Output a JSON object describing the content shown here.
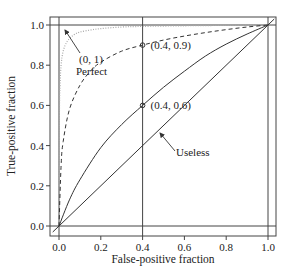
{
  "chart_data": {
    "type": "line",
    "title": "",
    "xlabel": "False-positive fraction",
    "ylabel": "True-positive fraction",
    "xlim": [
      -0.04,
      1.04
    ],
    "ylim": [
      -0.04,
      1.04
    ],
    "x_ticks": [
      "0.0",
      "0.2",
      "0.4",
      "0.6",
      "0.8",
      "1.0"
    ],
    "y_ticks": [
      "0.0",
      "0.2",
      "0.4",
      "0.6",
      "0.8",
      "1.0"
    ],
    "grid": false,
    "reference_lines": {
      "vertical": [
        0.0,
        0.4,
        1.0
      ],
      "horizontal": [
        0.0,
        1.0
      ]
    },
    "series": [
      {
        "name": "Perfect",
        "style": "dotted",
        "color": "#aaaaaa",
        "x": [
          0.0,
          0.002,
          0.005,
          0.01,
          0.02,
          0.04,
          0.07,
          0.1,
          0.15,
          0.2,
          0.3,
          0.4,
          0.6,
          0.8,
          1.0
        ],
        "y": [
          0.0,
          0.55,
          0.7,
          0.8,
          0.87,
          0.92,
          0.95,
          0.965,
          0.975,
          0.982,
          0.99,
          0.993,
          0.996,
          0.998,
          1.0
        ]
      },
      {
        "name": "Good",
        "style": "dashed",
        "color": "#333333",
        "x": [
          0.0,
          0.01,
          0.02,
          0.05,
          0.1,
          0.15,
          0.2,
          0.3,
          0.4,
          0.5,
          0.6,
          0.7,
          0.8,
          0.9,
          1.0
        ],
        "y": [
          0.0,
          0.3,
          0.42,
          0.58,
          0.7,
          0.77,
          0.815,
          0.87,
          0.9,
          0.925,
          0.945,
          0.962,
          0.977,
          0.99,
          1.0
        ]
      },
      {
        "name": "Moderate",
        "style": "solid",
        "color": "#333333",
        "x": [
          0.0,
          0.05,
          0.1,
          0.2,
          0.3,
          0.4,
          0.5,
          0.6,
          0.7,
          0.8,
          0.9,
          1.0
        ],
        "y": [
          0.0,
          0.13,
          0.23,
          0.39,
          0.505,
          0.6,
          0.69,
          0.77,
          0.845,
          0.905,
          0.955,
          1.0
        ]
      },
      {
        "name": "Useless",
        "style": "solid",
        "color": "#333333",
        "x": [
          -0.03,
          0.0,
          1.0,
          1.03
        ],
        "y": [
          -0.03,
          0.0,
          1.0,
          1.03
        ]
      }
    ],
    "markers": [
      {
        "x": 0.4,
        "y": 0.9,
        "label": "(0.4, 0.9)"
      },
      {
        "x": 0.4,
        "y": 0.6,
        "label": "(0.4, 0.6)"
      }
    ],
    "annotations": [
      {
        "text": "(0, 1)",
        "x": 0.1,
        "y": 0.82,
        "arrow_to": [
          0.0,
          1.0
        ]
      },
      {
        "text": "Perfect",
        "x": 0.1,
        "y": 0.76
      },
      {
        "text": "Useless",
        "x": 0.54,
        "y": 0.36,
        "arrow_to": [
          0.4,
          0.42
        ]
      }
    ]
  }
}
